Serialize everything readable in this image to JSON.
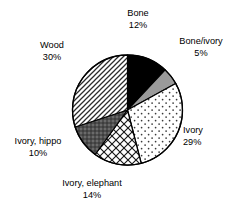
{
  "chart_data": {
    "type": "pie",
    "title": "",
    "subtitle": "",
    "xlabel": "",
    "ylabel": "",
    "legend_position": "none",
    "grid": false,
    "labels_show_percent": true,
    "start_angle_deg": 0,
    "direction": "clockwise",
    "categories": [
      "Bone",
      "Bone/ivory",
      "Ivory",
      "Ivory, elephant",
      "Ivory, hippo",
      "Wood"
    ],
    "values": [
      12,
      5,
      29,
      14,
      10,
      30
    ],
    "units": "%",
    "slices": [
      {
        "label": "Bone",
        "percent": 12,
        "percent_text": "12%",
        "fill_style": "solid-black",
        "fill_color": "#000000"
      },
      {
        "label": "Bone/ivory",
        "percent": 5,
        "percent_text": "5%",
        "fill_style": "solid-gray",
        "fill_color": "#9a9a9a"
      },
      {
        "label": "Ivory",
        "percent": 29,
        "percent_text": "29%",
        "fill_style": "sparse-dots",
        "fill_color": "#ffffff"
      },
      {
        "label": "Ivory, elephant",
        "percent": 14,
        "percent_text": "14%",
        "fill_style": "cross-hatch",
        "fill_color": "#ffffff"
      },
      {
        "label": "Ivory, hippo",
        "percent": 10,
        "percent_text": "10%",
        "fill_style": "dense-dark",
        "fill_color": "#5a5a5a"
      },
      {
        "label": "Wood",
        "percent": 30,
        "percent_text": "30%",
        "fill_style": "diagonal-hatch",
        "fill_color": "#ffffff"
      }
    ],
    "outline_color": "#000000"
  }
}
